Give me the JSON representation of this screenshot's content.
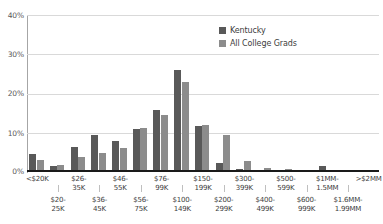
{
  "chart_data": {
    "type": "bar",
    "title": "",
    "subtitle": "",
    "xlabel": "",
    "ylabel": "",
    "ylim": [
      0,
      40
    ],
    "y_ticks": [
      "0%",
      "10%",
      "20%",
      "30%",
      "40%"
    ],
    "y_tick_values": [
      0,
      10,
      20,
      30,
      40
    ],
    "grid": true,
    "legend_position": "top-right",
    "categories": [
      "<$20K",
      "$20-25K",
      "$26-35K",
      "$36-45K",
      "$46-55K",
      "$56-75K",
      "$76-99K",
      "$100-149K",
      "$150-199K",
      "$200-299K",
      "$300-399K",
      "$400-499K",
      "$500-599K",
      "$600-999K",
      "$1MM-1.5MM",
      "$1.6MM-1.99MM",
      ">$2MM"
    ],
    "series": [
      {
        "name": "Kentucky",
        "color": "#595959",
        "values": [
          4.6,
          1.5,
          6.3,
          9.5,
          7.8,
          10.9,
          15.7,
          26.0,
          11.7,
          2.3,
          0.8,
          0.2,
          0.6,
          0.2,
          1.5,
          0.1,
          0.1
        ]
      },
      {
        "name": "All College Grads",
        "color": "#8c8c8c",
        "values": [
          3.0,
          1.7,
          3.7,
          4.9,
          6.0,
          11.1,
          14.5,
          22.9,
          12.1,
          9.4,
          2.7,
          1.1,
          0.7,
          0.6,
          0.3,
          0.2,
          0.3
        ]
      }
    ],
    "x_axis_rows": {
      "top": [
        "<$20K",
        "$26-\n35K",
        "$46-\n55K",
        "$76-\n99K",
        "$150-\n199K",
        "$300-\n399K",
        "$500-\n599K",
        "$1MM-\n1.5MM",
        ">$2MM"
      ],
      "bottom": [
        "$20-\n25K",
        "$36-\n45K",
        "$56-\n75K",
        "$100-\n149K",
        "$200-\n299K",
        "$400-\n499K",
        "$600-\n999K",
        "$1.6MM-\n1.99MM"
      ]
    }
  },
  "legend": {
    "items": [
      {
        "label": "Kentucky"
      },
      {
        "label": "All College Grads"
      }
    ]
  },
  "y_axis": {
    "ticks": [
      "40%",
      "30%",
      "20%",
      "10%",
      "0%"
    ]
  },
  "colors": {
    "series_a": "#595959",
    "series_b": "#8c8c8c",
    "grid": "#d9d9d9",
    "axis": "#1a1a1a",
    "text": "#404040",
    "background": "#ffffff"
  }
}
